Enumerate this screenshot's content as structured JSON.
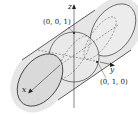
{
  "diagram": {
    "axes": {
      "x_label": "x",
      "y_label": "y",
      "z_label": "z"
    },
    "points": [
      {
        "label": "(0, 0, 1)"
      },
      {
        "label": "(0, 1, 0)"
      }
    ],
    "colors": {
      "stroke": "#333333",
      "fill_cylinder": "#e4e4e4",
      "fill_end": "#d8d8d8",
      "background": "#ffffff"
    }
  }
}
